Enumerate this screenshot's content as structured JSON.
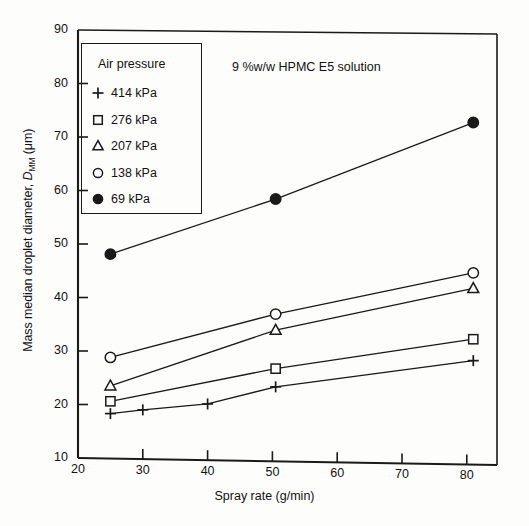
{
  "chart_data": {
    "type": "line",
    "title": "9 %w/w HPMC E5 solution",
    "xlabel": "Spray rate (g/min)",
    "ylabel": "Mass median droplet diameter, D_MM (μm)",
    "xlim": [
      20,
      85
    ],
    "ylim": [
      10,
      90
    ],
    "xticks": [
      20,
      30,
      40,
      50,
      60,
      70,
      80
    ],
    "yticks": [
      10,
      20,
      30,
      40,
      50,
      60,
      70,
      80,
      90
    ],
    "grid": false,
    "legend_position": "upper-left-inside",
    "legend_title": "Air pressure",
    "series": [
      {
        "name": "414 kPa",
        "marker": "plus",
        "filled": false,
        "x": [
          25,
          30,
          40,
          50.5,
          81
        ],
        "y": [
          18.3,
          19.0,
          20.1,
          23.3,
          28.2
        ]
      },
      {
        "name": "276 kPa",
        "marker": "square",
        "filled": false,
        "x": [
          25,
          50.5,
          81
        ],
        "y": [
          20.6,
          26.7,
          32.2
        ]
      },
      {
        "name": "207 kPa",
        "marker": "triangle",
        "filled": false,
        "x": [
          25,
          50.5,
          81
        ],
        "y": [
          23.5,
          33.9,
          41.7
        ]
      },
      {
        "name": "138 kPa",
        "marker": "circle",
        "filled": false,
        "x": [
          25,
          50.5,
          81
        ],
        "y": [
          28.8,
          36.9,
          44.6
        ]
      },
      {
        "name": "69 kPa",
        "marker": "circle",
        "filled": true,
        "x": [
          25,
          50.5,
          81
        ],
        "y": [
          48.1,
          58.4,
          72.7
        ]
      }
    ]
  },
  "axes": {
    "x_title": "Spray rate (g/min)",
    "y_title_main": "Mass median droplet diameter, ",
    "y_title_symbol": "D",
    "y_title_sub": "MM",
    "y_title_unit": " (μm)",
    "x_tick_labels": [
      "20",
      "30",
      "40",
      "50",
      "60",
      "70",
      "80"
    ],
    "y_tick_labels": [
      "10",
      "20",
      "30",
      "40",
      "50",
      "60",
      "70",
      "80",
      "90"
    ]
  },
  "legend": {
    "title": "Air pressure",
    "items": [
      {
        "symbol": "plus-marker",
        "label": "414 kPa"
      },
      {
        "symbol": "square-marker",
        "label": "276 kPa"
      },
      {
        "symbol": "triangle-marker",
        "label": "207 kPa"
      },
      {
        "symbol": "circle-marker",
        "label": "138 kPa"
      },
      {
        "symbol": "filled-circle-marker",
        "label": "69 kPa"
      }
    ]
  },
  "annotation": {
    "text": "9 %w/w HPMC E5 solution"
  },
  "colors": {
    "line": "#1a1a1a",
    "axis": "#1a1a1a",
    "background": "#fdfdfc"
  }
}
